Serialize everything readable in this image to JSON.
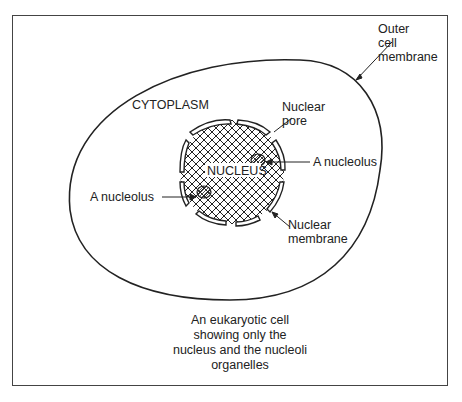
{
  "diagram": {
    "title": "Eukaryotic cell",
    "labels": {
      "outer_membrane": "Outer cell membrane",
      "outer_membrane_lines": [
        "Outer",
        "cell",
        "membrane"
      ],
      "cytoplasm": "CYTOPLASM",
      "nuclear_pore_lines": [
        "Nuclear",
        "pore"
      ],
      "nucleolus_right": "A nucleolus",
      "nucleolus_left": "A nucleolus",
      "nucleus": "NUCLEUS",
      "nuclear_membrane_lines": [
        "Nuclear",
        "membrane"
      ]
    },
    "caption_lines": [
      "An eukaryotic cell",
      "showing only the",
      "nucleus and the nucleoli",
      "organelles"
    ]
  }
}
